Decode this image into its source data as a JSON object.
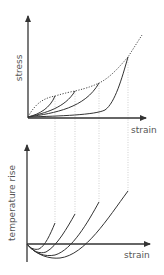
{
  "upper_plot": {
    "y_label": "stress",
    "x_label": "strain"
  },
  "lower_plot": {
    "y_label": "temperature rise",
    "x_label": "strain"
  },
  "colors": {
    "axis": "#333333",
    "curve": "#333333",
    "dotted_guide": "#bbbbbb",
    "label": "#555555"
  }
}
